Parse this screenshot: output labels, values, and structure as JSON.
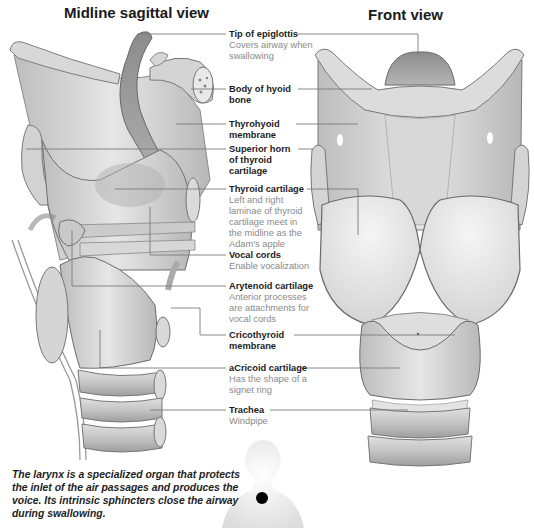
{
  "titles": {
    "left": "Midline sagittal view",
    "right": "Front view"
  },
  "labels": [
    {
      "name": "Tip of epiglottis",
      "desc": "Covers airway when swallowing"
    },
    {
      "name": "Body of hyoid bone",
      "desc": ""
    },
    {
      "name": "Thyrohyoid membrane",
      "desc": ""
    },
    {
      "name": "Superior horn of thyroid cartilage",
      "desc": ""
    },
    {
      "name": "Thyroid cartilage",
      "desc": "Left and right laminae of thyroid cartilage meet in the midline as the Adam's apple"
    },
    {
      "name": "Vocal cords",
      "desc": "Enable vocalization"
    },
    {
      "name": "Arytenoid cartilage",
      "desc": "Anterior processes are attachments for vocal cords"
    },
    {
      "name": "Cricothyroid membrane",
      "desc": ""
    },
    {
      "name": "aCricoid cartilage",
      "desc": "Has the shape of a signet ring"
    },
    {
      "name": "Trachea",
      "desc": "Windpipe"
    }
  ],
  "caption": "The larynx is a specialized organ that protects the inlet of the air passages and produces the voice. Its intrinsic sphincters close the airway during swallowing.",
  "colors": {
    "cartilage": "#cfcfcf",
    "shadow": "#9a9a9a",
    "leader_line": "#7a7a7a",
    "locator_dot": "#000000"
  }
}
